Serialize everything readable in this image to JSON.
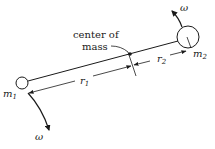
{
  "diagram": {
    "labels": {
      "center_of_mass_line1": "center of",
      "center_of_mass_line2": "mass",
      "r1": "r",
      "r1_sub": "1",
      "r2": "r",
      "r2_sub": "2",
      "m1": "m",
      "m1_sub": "1",
      "m2": "m",
      "m2_sub": "2",
      "omega_top": "ω",
      "omega_bottom": "ω"
    },
    "colors": {
      "ink": "#1a1a1a",
      "background": "#ffffff"
    },
    "elements": [
      {
        "id": "mass-1",
        "type": "circle",
        "label": "m1",
        "size": "small"
      },
      {
        "id": "mass-2",
        "type": "circle",
        "label": "m2",
        "size": "large"
      },
      {
        "id": "rod",
        "type": "line",
        "connects": [
          "m1",
          "m2"
        ]
      },
      {
        "id": "center-of-mass",
        "type": "point",
        "label": "center of mass"
      },
      {
        "id": "r1-dimension",
        "type": "dimension",
        "label": "r1",
        "from": "m1",
        "to": "center-of-mass"
      },
      {
        "id": "r2-dimension",
        "type": "dimension",
        "label": "r2",
        "from": "center-of-mass",
        "to": "m2"
      },
      {
        "id": "omega-arrow-top",
        "type": "curved-arrow",
        "label": "ω",
        "at": "m2"
      },
      {
        "id": "omega-arrow-bottom",
        "type": "curved-arrow",
        "label": "ω",
        "at": "m1"
      }
    ]
  }
}
